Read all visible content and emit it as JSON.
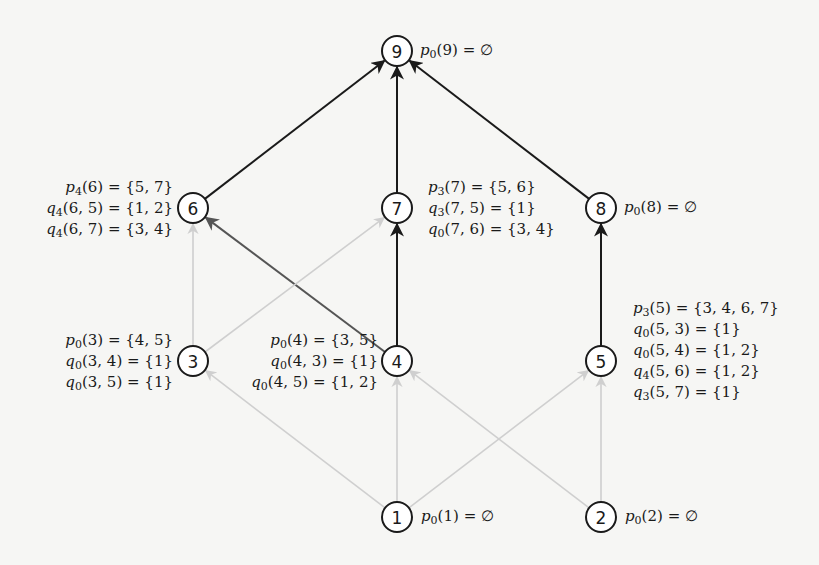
{
  "diagram": {
    "type": "directed-graph",
    "nodes": [
      {
        "id": "9",
        "label": "9",
        "x": 397,
        "y": 51
      },
      {
        "id": "6",
        "label": "6",
        "x": 193,
        "y": 208
      },
      {
        "id": "7",
        "label": "7",
        "x": 397,
        "y": 208
      },
      {
        "id": "8",
        "label": "8",
        "x": 601,
        "y": 208
      },
      {
        "id": "3",
        "label": "3",
        "x": 193,
        "y": 361
      },
      {
        "id": "4",
        "label": "4",
        "x": 397,
        "y": 361
      },
      {
        "id": "5",
        "label": "5",
        "x": 601,
        "y": 361
      },
      {
        "id": "1",
        "label": "1",
        "x": 397,
        "y": 517
      },
      {
        "id": "2",
        "label": "2",
        "x": 601,
        "y": 517
      }
    ],
    "edges": [
      {
        "from": "6",
        "to": "9",
        "style": "dark"
      },
      {
        "from": "7",
        "to": "9",
        "style": "dark"
      },
      {
        "from": "8",
        "to": "9",
        "style": "dark"
      },
      {
        "from": "4",
        "to": "7",
        "style": "dark"
      },
      {
        "from": "5",
        "to": "8",
        "style": "dark"
      },
      {
        "from": "4",
        "to": "6",
        "style": "mid"
      },
      {
        "from": "3",
        "to": "6",
        "style": "light"
      },
      {
        "from": "3",
        "to": "7",
        "style": "light"
      },
      {
        "from": "1",
        "to": "3",
        "style": "light"
      },
      {
        "from": "1",
        "to": "4",
        "style": "light"
      },
      {
        "from": "1",
        "to": "5",
        "style": "light"
      },
      {
        "from": "2",
        "to": "4",
        "style": "light"
      },
      {
        "from": "2",
        "to": "5",
        "style": "light"
      }
    ],
    "colors": {
      "dark": "#1a1a1a",
      "mid": "#555555",
      "light": "#cfcfcf",
      "background": "#f6f6f4"
    },
    "annotations": {
      "node9": [
        "p0(9) = ∅"
      ],
      "node6": [
        "p4(6) = {5, 7}",
        "q4(6, 5) = {1, 2}",
        "q4(6, 7) = {3, 4}"
      ],
      "node7": [
        "p3(7) = {5, 6}",
        "q3(7, 5) = {1}",
        "q0(7, 6) = {3, 4}"
      ],
      "node8": [
        "p0(8) = ∅"
      ],
      "node3": [
        "p0(3) = {4, 5}",
        "q0(3, 4) = {1}",
        "q0(3, 5) = {1}"
      ],
      "node4": [
        "p0(4) = {3, 5}",
        "q0(4, 3) = {1}",
        "q0(4, 5) = {1, 2}"
      ],
      "node5": [
        "p3(5) = {3, 4, 6, 7}",
        "q0(5, 3) = {1}",
        "q0(5, 4) = {1, 2}",
        "q4(5, 6) = {1, 2}",
        "q3(5, 7) = {1}"
      ],
      "node1": [
        "p0(1) = ∅"
      ],
      "node2": [
        "p0(2) = ∅"
      ]
    },
    "annotation_parts": {
      "node9": [
        {
          "f": "p",
          "s": "0",
          "a": "(9) = ∅"
        }
      ],
      "node6": [
        {
          "f": "p",
          "s": "4",
          "a": "(6) = {5, 7}"
        },
        {
          "f": "q",
          "s": "4",
          "a": "(6, 5) = {1, 2}"
        },
        {
          "f": "q",
          "s": "4",
          "a": "(6, 7) = {3, 4}"
        }
      ],
      "node7": [
        {
          "f": "p",
          "s": "3",
          "a": "(7) = {5, 6}"
        },
        {
          "f": "q",
          "s": "3",
          "a": "(7, 5) = {1}"
        },
        {
          "f": "q",
          "s": "0",
          "a": "(7, 6) = {3, 4}"
        }
      ],
      "node8": [
        {
          "f": "p",
          "s": "0",
          "a": "(8) = ∅"
        }
      ],
      "node3": [
        {
          "f": "p",
          "s": "0",
          "a": "(3) = {4, 5}"
        },
        {
          "f": "q",
          "s": "0",
          "a": "(3, 4) = {1}"
        },
        {
          "f": "q",
          "s": "0",
          "a": "(3, 5) = {1}"
        }
      ],
      "node4": [
        {
          "f": "p",
          "s": "0",
          "a": "(4) = {3, 5}"
        },
        {
          "f": "q",
          "s": "0",
          "a": "(4, 3) = {1}"
        },
        {
          "f": "q",
          "s": "0",
          "a": "(4, 5) = {1, 2}"
        }
      ],
      "node5": [
        {
          "f": "p",
          "s": "3",
          "a": "(5) = {3, 4, 6, 7}"
        },
        {
          "f": "q",
          "s": "0",
          "a": "(5, 3) = {1}"
        },
        {
          "f": "q",
          "s": "0",
          "a": "(5, 4) = {1, 2}"
        },
        {
          "f": "q",
          "s": "4",
          "a": "(5, 6) = {1, 2}"
        },
        {
          "f": "q",
          "s": "3",
          "a": "(5, 7) = {1}"
        }
      ],
      "node1": [
        {
          "f": "p",
          "s": "0",
          "a": "(1) = ∅"
        }
      ],
      "node2": [
        {
          "f": "p",
          "s": "0",
          "a": "(2) = ∅"
        }
      ]
    }
  }
}
